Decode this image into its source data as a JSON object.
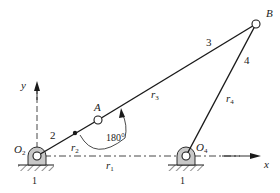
{
  "diagram": {
    "type": "four-bar-linkage",
    "colors": {
      "line": "#1a1a1a",
      "ground_fill": "#bdbdbd",
      "pivot_fill": "#c8c8c8",
      "text": "#222222"
    },
    "axes": {
      "x_label": "x",
      "y_label": "y"
    },
    "points": {
      "O2": {
        "label": "O",
        "sub": "2"
      },
      "O4": {
        "label": "O",
        "sub": "4"
      },
      "A": {
        "label": "A"
      },
      "B": {
        "label": "B"
      }
    },
    "links": {
      "ground_left": "1",
      "ground_right": "1",
      "crank": "2",
      "coupler": "3",
      "rocker": "4"
    },
    "vectors": {
      "r1": {
        "label": "r",
        "sub": "1"
      },
      "r2": {
        "label": "r",
        "sub": "2"
      },
      "r3": {
        "label": "r",
        "sub": "3"
      },
      "r4": {
        "label": "r",
        "sub": "4"
      }
    },
    "angle_annotation": "180°"
  }
}
